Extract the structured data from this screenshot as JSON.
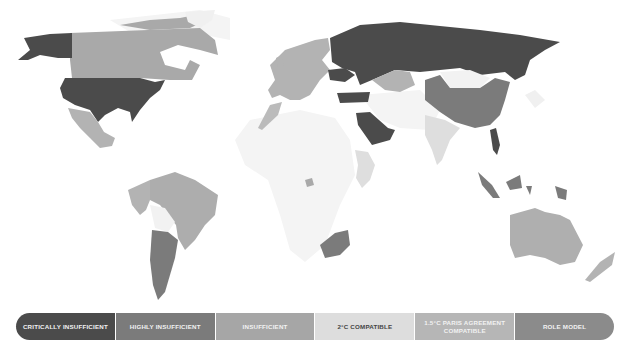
{
  "colors": {
    "critically_insufficient": "#4b4b4b",
    "highly_insufficient": "#7b7b7b",
    "insufficient": "#a6a6a6",
    "two_c_compatible": "#dddddd",
    "one_five_c_compatible": "#b6b6b6",
    "role_model": "#8b8b8b",
    "no_data": "#f3f3f3"
  },
  "legend": {
    "items": [
      {
        "label": "CRITICALLY INSUFFICIENT",
        "color": "#4b4b4b"
      },
      {
        "label": "HIGHLY INSUFFICIENT",
        "color": "#7b7b7b"
      },
      {
        "label": "INSUFFICIENT",
        "color": "#a6a6a6"
      },
      {
        "label": "2°C COMPATIBLE",
        "color": "#dddddd"
      },
      {
        "label": "1.5°C PARIS AGREEMENT COMPATIBLE",
        "color": "#b6b6b6"
      },
      {
        "label": "ROLE MODEL",
        "color": "#8b8b8b"
      }
    ]
  },
  "map": {
    "regions": [
      {
        "name": "USA",
        "rating": "critically_insufficient"
      },
      {
        "name": "Alaska",
        "rating": "critically_insufficient"
      },
      {
        "name": "Russia",
        "rating": "critically_insufficient"
      },
      {
        "name": "Ukraine",
        "rating": "critically_insufficient"
      },
      {
        "name": "Turkey",
        "rating": "critically_insufficient"
      },
      {
        "name": "Saudi Arabia",
        "rating": "critically_insufficient"
      },
      {
        "name": "Vietnam",
        "rating": "critically_insufficient"
      },
      {
        "name": "Canada",
        "rating": "insufficient"
      },
      {
        "name": "Mexico",
        "rating": "insufficient"
      },
      {
        "name": "Europe",
        "rating": "insufficient"
      },
      {
        "name": "Kazakhstan",
        "rating": "insufficient"
      },
      {
        "name": "Brazil",
        "rating": "insufficient"
      },
      {
        "name": "Colombia/Peru",
        "rating": "insufficient"
      },
      {
        "name": "Australia",
        "rating": "insufficient"
      },
      {
        "name": "New Zealand",
        "rating": "insufficient"
      },
      {
        "name": "China",
        "rating": "highly_insufficient"
      },
      {
        "name": "Argentina",
        "rating": "highly_insufficient"
      },
      {
        "name": "Chile",
        "rating": "highly_insufficient"
      },
      {
        "name": "Indonesia",
        "rating": "highly_insufficient"
      },
      {
        "name": "South Africa",
        "rating": "highly_insufficient"
      },
      {
        "name": "Singapore",
        "rating": "highly_insufficient"
      },
      {
        "name": "India",
        "rating": "two_c_compatible"
      },
      {
        "name": "Ethiopia/Kenya",
        "rating": "two_c_compatible"
      },
      {
        "name": "Morocco",
        "rating": "one_five_c_compatible"
      },
      {
        "name": "Gambia",
        "rating": "one_five_c_compatible"
      }
    ]
  }
}
